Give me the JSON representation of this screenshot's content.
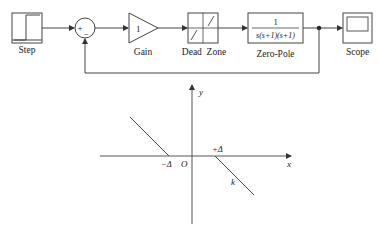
{
  "block_diagram": {
    "blocks": {
      "step": {
        "label": "Step"
      },
      "sum": {
        "plus": "+",
        "minus": "−"
      },
      "gain": {
        "label": "Gain",
        "value": "1"
      },
      "dead_zone": {
        "label": "Dead  Zone"
      },
      "zero_pole": {
        "label": "Zero-Pole",
        "numerator": "1",
        "denominator": "s(s+1)(s+1)"
      },
      "scope": {
        "label": "Scope"
      }
    }
  },
  "characteristic_plot": {
    "x_axis_label": "x",
    "y_axis_label": "y",
    "origin_label": "O",
    "neg_threshold_label": "−Δ",
    "pos_threshold_label": "+Δ",
    "slope_label": "k"
  },
  "colors": {
    "line": "#333333",
    "background": "#ffffff"
  }
}
